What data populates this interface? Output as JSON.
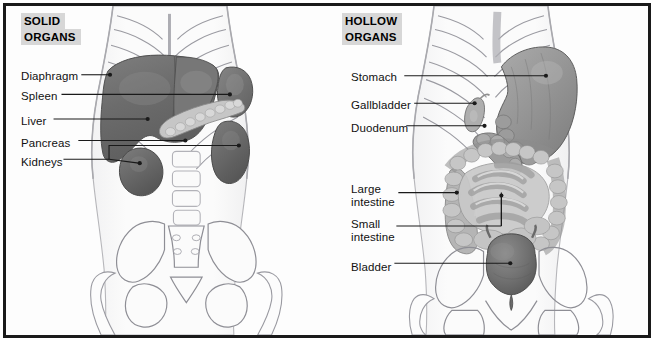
{
  "figure": {
    "panels": [
      {
        "id": "solid-organs",
        "title_line1": "SOLID",
        "title_line2": "ORGANS",
        "labels": [
          {
            "name": "diaphragm",
            "text": "Diaphragm"
          },
          {
            "name": "spleen",
            "text": "Spleen"
          },
          {
            "name": "liver",
            "text": "Liver"
          },
          {
            "name": "pancreas",
            "text": "Pancreas"
          },
          {
            "name": "kidneys",
            "text": "Kidneys"
          }
        ]
      },
      {
        "id": "hollow-organs",
        "title_line1": "HOLLOW",
        "title_line2": "ORGANS",
        "labels": [
          {
            "name": "stomach",
            "text": "Stomach"
          },
          {
            "name": "gallbladder",
            "text": "Gallbladder"
          },
          {
            "name": "duodenum",
            "text": "Duodenum"
          },
          {
            "name": "large-intestine",
            "text": "Large\nintestine"
          },
          {
            "name": "small-intestine",
            "text": "Small\nintestine"
          },
          {
            "name": "bladder",
            "text": "Bladder"
          }
        ]
      }
    ]
  },
  "colors": {
    "frame": "#1a1a1a",
    "title_highlight": "#d7d7d7",
    "leader_line": "#1a1a1a",
    "organ_dark": "#6e6e6e",
    "organ_mid": "#8e8e8e",
    "organ_light": "#b9b9b9",
    "bone_outline": "#6b6b72",
    "body_outline": "#b0b0b4",
    "background": "#fdfdfd"
  }
}
